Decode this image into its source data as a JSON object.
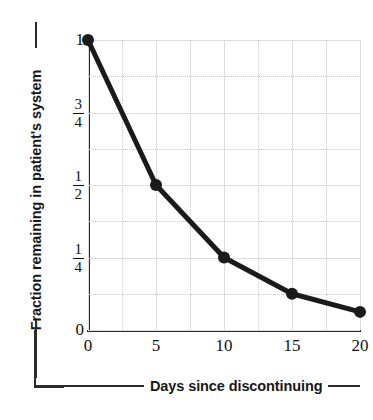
{
  "chart_data": {
    "type": "line",
    "title": "",
    "subtitle": "",
    "xlabel": "Days since discontinuing",
    "ylabel": "Fraction remaining in patient's system",
    "x": [
      0,
      5,
      10,
      15,
      20
    ],
    "values": [
      1,
      0.5,
      0.25,
      0.125,
      0.0625
    ],
    "series": [
      {
        "name": "Fraction remaining",
        "x": [
          0,
          5,
          10,
          15,
          20
        ],
        "values": [
          1,
          0.5,
          0.25,
          0.125,
          0.0625
        ],
        "value_labels": [
          "1",
          "1/2",
          "1/4",
          "1/8",
          "1/16"
        ],
        "color": "#1a1a1a",
        "marker": "circle",
        "marker_size": 9,
        "line_width": 5
      }
    ],
    "xlim": [
      0,
      20
    ],
    "ylim": [
      0,
      1
    ],
    "xticks": [
      0,
      5,
      10,
      15,
      20
    ],
    "xtick_labels": [
      "0",
      "5",
      "10",
      "15",
      "20"
    ],
    "yticks": [
      0,
      0.25,
      0.5,
      0.75,
      1
    ],
    "ytick_labels": [
      "0",
      "1/4",
      "1/2",
      "3/4",
      "1"
    ],
    "ytick_fractions": [
      {
        "value": 0,
        "whole": "0",
        "num": "",
        "den": ""
      },
      {
        "value": 0.25,
        "whole": "",
        "num": "1",
        "den": "4"
      },
      {
        "value": 0.5,
        "whole": "",
        "num": "1",
        "den": "2"
      },
      {
        "value": 0.75,
        "whole": "",
        "num": "3",
        "den": "4"
      },
      {
        "value": 1,
        "whole": "1",
        "num": "",
        "den": ""
      }
    ],
    "grid": true,
    "grid_y_step": 0.125,
    "grid_x_step": 2.5,
    "grid_color_major": "#dcdcdc",
    "grid_color_minor": "#c9c9c9",
    "legend": false,
    "legend_position": "none",
    "axis_color": "#2b2b2b",
    "background_color": "#ffffff",
    "annotations": []
  },
  "axis_titles": {
    "y": "Fraction remaining in patient's system",
    "x": "Days since discontinuing"
  }
}
